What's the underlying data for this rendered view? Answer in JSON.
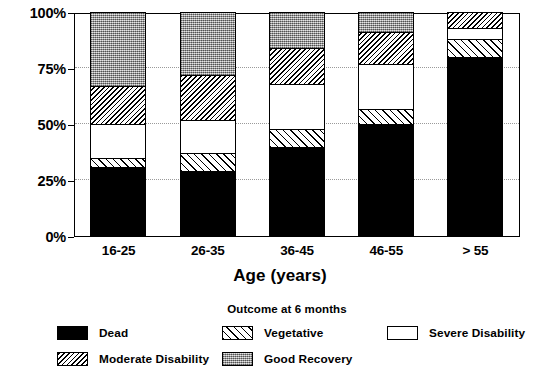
{
  "chart_data": {
    "type": "bar",
    "subtype": "stacked-100-percent",
    "title": "",
    "xlabel": "Age (years)",
    "ylabel": "",
    "categories": [
      "16-25",
      "26-35",
      "36-45",
      "46-55",
      "> 55"
    ],
    "ylim": [
      0,
      100
    ],
    "ytick_labels": [
      "0%",
      "25%",
      "50%",
      "75%",
      "100%"
    ],
    "ytick_values": [
      0,
      25,
      50,
      75,
      100
    ],
    "grid": "horizontal-dotted",
    "legend_position": "bottom",
    "legend_title": "Outcome at 6 months",
    "stack_order": "bottom-to-top",
    "series": [
      {
        "name": "Dead",
        "pattern": "solid-black",
        "color": "#000000",
        "values": [
          31,
          29,
          40,
          50,
          80
        ]
      },
      {
        "name": "Vegetative",
        "pattern": "forward-hatch",
        "color": "#ffffff",
        "values": [
          4,
          8,
          8,
          7,
          8
        ]
      },
      {
        "name": "Severe Disability",
        "pattern": "solid-white",
        "color": "#ffffff",
        "values": [
          15,
          15,
          20,
          20,
          5
        ]
      },
      {
        "name": "Moderate Disability",
        "pattern": "dense-back-hatch",
        "color": "#ffffff",
        "values": [
          17,
          20,
          16,
          14,
          7
        ]
      },
      {
        "name": "Good Recovery",
        "pattern": "gray-stipple",
        "color": "#a8a8a8",
        "values": [
          33,
          28,
          16,
          9,
          0
        ]
      }
    ]
  },
  "legend": {
    "title": "Outcome at 6 months",
    "items": [
      {
        "label": "Dead",
        "pattern": "solid-black"
      },
      {
        "label": "Vegetative",
        "pattern": "forward-hatch"
      },
      {
        "label": "Severe Disability",
        "pattern": "solid-white"
      },
      {
        "label": "Moderate Disability",
        "pattern": "dense-back-hatch"
      },
      {
        "label": "Good Recovery",
        "pattern": "gray-stipple"
      }
    ]
  }
}
